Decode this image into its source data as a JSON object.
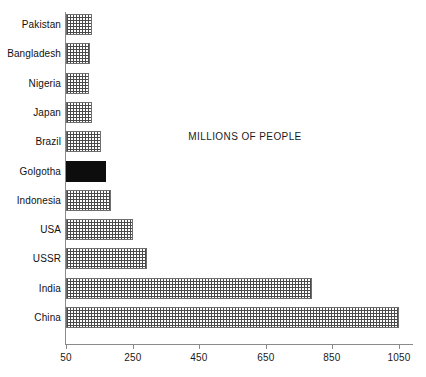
{
  "chart_data": {
    "type": "bar",
    "orientation": "horizontal",
    "title": "MILLIONS OF PEOPLE",
    "xlabel": "",
    "ylabel": "",
    "xlim": [
      50,
      1085
    ],
    "grid": false,
    "legend": null,
    "xticks": [
      50,
      250,
      450,
      650,
      850,
      1050
    ],
    "xtick_labels": [
      "50",
      "250",
      "450",
      "650",
      "850",
      "1050"
    ],
    "categories": [
      "Pakistan",
      "Bangladesh",
      "Nigeria",
      "Japan",
      "Brazil",
      "Golgotha",
      "Indonesia",
      "USA",
      "USSR",
      "India",
      "China"
    ],
    "values": [
      128,
      122,
      120,
      129,
      155,
      170,
      185,
      250,
      292,
      790,
      1050
    ],
    "bar_styles": [
      "pattern",
      "pattern",
      "pattern",
      "pattern",
      "pattern",
      "solid",
      "pattern",
      "pattern",
      "pattern",
      "pattern",
      "pattern"
    ],
    "highlight_category": "Golgotha",
    "colors": {
      "bar_pattern_ink": "#4a4a4a",
      "bar_pattern_ground": "#ffffff",
      "bar_border": "#6e6e6e",
      "bar_solid": "#0d0d0d",
      "axis": "#8a8a8a",
      "text": "#111111",
      "background": "#ffffff"
    }
  }
}
